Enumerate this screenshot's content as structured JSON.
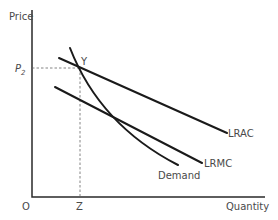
{
  "diagram": {
    "type": "economics-cost-curves",
    "axes": {
      "y_label": "Price",
      "x_label": "Quantity",
      "origin_label": "O"
    },
    "markers": {
      "price_label": "P",
      "price_subscript": "2",
      "quantity_label": "Z",
      "point_label": "Y"
    },
    "curves": [
      {
        "name": "LRAC",
        "label": "LRAC"
      },
      {
        "name": "LRMC",
        "label": "LRMC"
      },
      {
        "name": "Demand",
        "label": "Demand"
      }
    ],
    "colors": {
      "curve": "#1a1a1a",
      "text": "#4a4a4a",
      "dash": "#666666"
    }
  }
}
